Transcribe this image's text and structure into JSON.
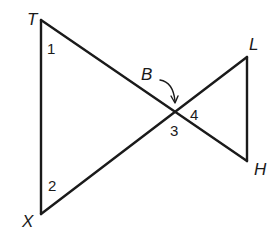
{
  "diagram": {
    "points": {
      "T": {
        "label": "T",
        "x": 41,
        "y": 20
      },
      "X": {
        "label": "X",
        "x": 41,
        "y": 214
      },
      "B": {
        "label": "B",
        "x": 175,
        "y": 112
      },
      "L": {
        "label": "L",
        "x": 247,
        "y": 57
      },
      "H": {
        "label": "H",
        "x": 247,
        "y": 161
      }
    },
    "segments": [
      "TX",
      "TH",
      "XL",
      "LH"
    ],
    "angles": {
      "a1": "1",
      "a2": "2",
      "a3": "3",
      "a4": "4"
    },
    "colors": {
      "stroke": "#1a1a1a",
      "background": "#ffffff"
    }
  }
}
